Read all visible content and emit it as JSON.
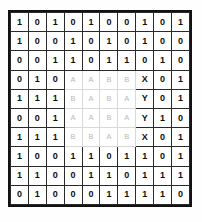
{
  "figure": {
    "name": "binary-matrix-grid",
    "rows": 10,
    "columns": 10,
    "border_color": "#121212",
    "cell_border_color": "#2a2a2a",
    "digit_color": "#0d0d0d",
    "faint_letter_color": "#b9b9b9",
    "background": "#ffffff"
  },
  "grid": {
    "cells": [
      [
        "1",
        "0",
        "1",
        "0",
        "1",
        "0",
        "0",
        "1",
        "0",
        "1"
      ],
      [
        "1",
        "0",
        "0",
        "1",
        "0",
        "1",
        "0",
        "1",
        "0",
        "0"
      ],
      [
        "0",
        "0",
        "1",
        "1",
        "0",
        "1",
        "1",
        "0",
        "1",
        "0"
      ],
      [
        "0",
        "1",
        "0",
        "A",
        "A",
        "B",
        "B",
        "X",
        "0",
        "1"
      ],
      [
        "1",
        "1",
        "1",
        "B",
        "A",
        "B",
        "A",
        "Y",
        "0",
        "1"
      ],
      [
        "0",
        "0",
        "1",
        "A",
        "A",
        "B",
        "A",
        "Y",
        "1",
        "0"
      ],
      [
        "1",
        "1",
        "1",
        "B",
        "B",
        "A",
        "B",
        "X",
        "0",
        "1"
      ],
      [
        "1",
        "0",
        "0",
        "1",
        "1",
        "0",
        "1",
        "1",
        "0",
        "1"
      ],
      [
        "1",
        "1",
        "0",
        "0",
        "1",
        "1",
        "0",
        "1",
        "1",
        "1"
      ],
      [
        "0",
        "1",
        "0",
        "0",
        "0",
        "1",
        "1",
        "1",
        "1",
        "0"
      ]
    ],
    "kinds": [
      [
        "digit",
        "digit",
        "digit",
        "digit",
        "digit",
        "digit",
        "digit",
        "digit",
        "digit",
        "digit"
      ],
      [
        "digit",
        "digit",
        "digit",
        "digit",
        "digit",
        "digit",
        "digit",
        "digit",
        "digit",
        "digit"
      ],
      [
        "digit",
        "digit",
        "digit",
        "digit",
        "digit",
        "digit",
        "digit",
        "digit",
        "digit",
        "digit"
      ],
      [
        "digit",
        "digit",
        "digit",
        "faint",
        "faint",
        "faint",
        "faint",
        "marker",
        "digit",
        "digit"
      ],
      [
        "digit",
        "digit",
        "digit",
        "faint",
        "faint",
        "faint",
        "faint",
        "marker",
        "digit",
        "digit"
      ],
      [
        "digit",
        "digit",
        "digit",
        "faint",
        "faint",
        "faint",
        "faint",
        "marker",
        "digit",
        "digit"
      ],
      [
        "digit",
        "digit",
        "digit",
        "faint",
        "faint",
        "faint",
        "faint",
        "marker",
        "digit",
        "digit"
      ],
      [
        "digit",
        "digit",
        "digit",
        "digit",
        "digit",
        "digit",
        "digit",
        "digit",
        "digit",
        "digit"
      ],
      [
        "digit",
        "digit",
        "digit",
        "digit",
        "digit",
        "digit",
        "digit",
        "digit",
        "digit",
        "digit"
      ],
      [
        "digit",
        "digit",
        "digit",
        "digit",
        "digit",
        "digit",
        "digit",
        "digit",
        "digit",
        "digit"
      ]
    ]
  }
}
